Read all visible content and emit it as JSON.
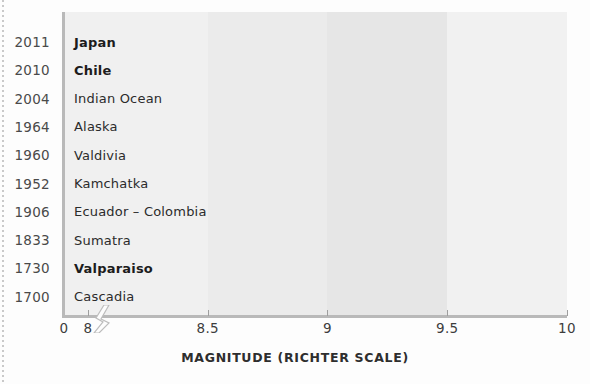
{
  "chart_data": {
    "type": "bar",
    "orientation": "horizontal",
    "title": "",
    "xlabel": "MAGNITUDE (RICHTER SCALE)",
    "ylabel": "",
    "xlim": [
      7.9,
      10
    ],
    "axis_break": true,
    "xticks": [
      0,
      8,
      8.5,
      9,
      9.5,
      10
    ],
    "xtick_labels": [
      "0",
      "8",
      "8.5",
      "9",
      "9.5",
      "10"
    ],
    "grid": false,
    "legend": "none",
    "categories": [
      "2011",
      "2010",
      "2004",
      "1964",
      "1960",
      "1952",
      "1906",
      "1833",
      "1730",
      "1700"
    ],
    "bar_labels": [
      "Japan",
      "Chile",
      "Indian Ocean",
      "Alaska",
      "Valdivia",
      "Kamchatka",
      "Ecuador – Colombia",
      "Sumatra",
      "Valparaiso",
      "Cascadia"
    ],
    "values": [
      9.0,
      8.8,
      9.1,
      9.2,
      9.5,
      9.0,
      8.8,
      9.1,
      8.7,
      8.7
    ],
    "bars": [
      {
        "year": "2011",
        "label": "Japan",
        "value": 9.0,
        "color": "#5d5d5d",
        "bold": true
      },
      {
        "year": "2010",
        "label": "Chile",
        "value": 8.8,
        "color": "#5a5a5a",
        "bold": true
      },
      {
        "year": "2004",
        "label": "Indian Ocean",
        "value": 9.1,
        "color": "#8f8f8f",
        "bold": false
      },
      {
        "year": "1964",
        "label": "Alaska",
        "value": 9.2,
        "color": "#9e9e9e",
        "bold": false
      },
      {
        "year": "1960",
        "label": "Valdivia",
        "value": 9.5,
        "color": "#cfcfcf",
        "bold": false
      },
      {
        "year": "1952",
        "label": "Kamchatka",
        "value": 9.0,
        "color": "#6e6e6e",
        "bold": false
      },
      {
        "year": "1906",
        "label": "Ecuador – Colombia",
        "value": 8.8,
        "color": "#8b8b8b",
        "bold": false
      },
      {
        "year": "1833",
        "label": "Sumatra",
        "value": 9.1,
        "color": "#9a9a9a",
        "bold": false
      },
      {
        "year": "1730",
        "label": "Valparaiso",
        "value": 8.7,
        "color": "#585858",
        "bold": true
      },
      {
        "year": "1700",
        "label": "Cascadia",
        "value": 8.7,
        "color": "#5c5c5c",
        "bold": false
      }
    ],
    "background_bands": [
      {
        "from": 7.9,
        "to": 8.5,
        "color": "#f0f0f0"
      },
      {
        "from": 8.5,
        "to": 9.0,
        "color": "#ebebeb"
      },
      {
        "from": 9.0,
        "to": 9.5,
        "color": "#e6e6e6"
      },
      {
        "from": 9.5,
        "to": 10.0,
        "color": "#f1f1f1"
      }
    ],
    "colors": {
      "axis": "#b9b9b9",
      "tick_text": "#3d3d3d",
      "year_text": "#4a4a4a",
      "bar_label_text": "#2b2b2b",
      "page_background": "#fdfdfd"
    }
  }
}
